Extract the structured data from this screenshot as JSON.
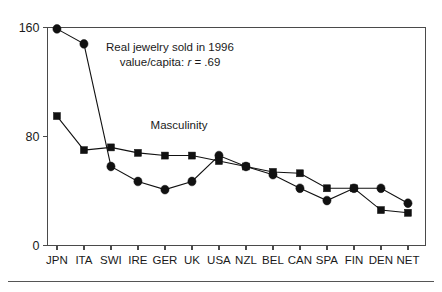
{
  "figure": {
    "background_color": "#ffffff",
    "ink_color": "#111111",
    "axis_color": "#4a4a4a"
  },
  "chart_data": {
    "type": "line",
    "title": "",
    "subtitle": "",
    "xlabel": "",
    "ylabel": "",
    "ylim": [
      0,
      160
    ],
    "yticks": [
      0,
      80,
      160
    ],
    "ytick_labels": [
      "0",
      "80",
      "160"
    ],
    "grid": false,
    "legend_position": "inline-annotations",
    "categories": [
      "JPN",
      "ITA",
      "SWI",
      "IRE",
      "GER",
      "UK",
      "USA",
      "NZL",
      "BEL",
      "CAN",
      "SPA",
      "FIN",
      "DEN",
      "NET"
    ],
    "series": [
      {
        "name": "Real jewelry sold in 1996 value/capita",
        "marker": "circle",
        "values": [
          159,
          148,
          58,
          47,
          41,
          47,
          66,
          58,
          52,
          42,
          33,
          42,
          42,
          31
        ]
      },
      {
        "name": "Masculinity",
        "marker": "square",
        "values": [
          95,
          70,
          72,
          68,
          66,
          66,
          62,
          58,
          54,
          53,
          42,
          42,
          26,
          24
        ]
      }
    ],
    "annotations": [
      {
        "id": "jewelry-annotation",
        "line1": "Real jewelry sold in 1996",
        "line2_prefix": "value/capita: ",
        "line2_italic": "r",
        "line2_suffix": " = .69",
        "x_category_fraction": 0.33,
        "y_value": 133
      },
      {
        "id": "masculinity-label",
        "text": "Masculinity",
        "x_category_fraction": 0.4,
        "y_value": 86
      }
    ]
  },
  "axes": {
    "y_axis_name": "y-axis",
    "x_axis_name": "x-axis",
    "tick_labels_x": [
      "JPN",
      "ITA",
      "SWI",
      "IRE",
      "GER",
      "UK",
      "USA",
      "NZL",
      "BEL",
      "CAN",
      "SPA",
      "FIN",
      "DEN",
      "NET"
    ],
    "tick_labels_y": [
      "160",
      "80",
      "0"
    ]
  },
  "footer": {
    "rule_visible": "true"
  }
}
